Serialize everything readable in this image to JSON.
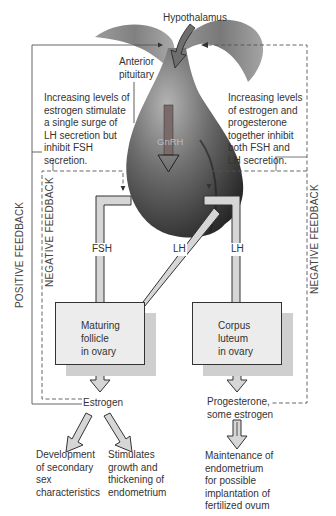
{
  "diagram": {
    "type": "hormonal-feedback-flowchart",
    "nodes": {
      "hypothalamus": "Hypothalamus",
      "anterior_pituitary": [
        "Anterior",
        "pituitary"
      ],
      "gnrh": "GnRH",
      "fsh": "FSH",
      "lh_left": "LH",
      "lh_right": "LH",
      "maturing_follicle": [
        "Maturing",
        "follicle",
        "in ovary"
      ],
      "corpus_luteum": [
        "Corpus",
        "luteum",
        "in ovary"
      ],
      "estrogen": "Estrogen",
      "progesterone": [
        "Progesterone,",
        "some estrogen"
      ],
      "secondary_sex": [
        "Development",
        "of secondary",
        "sex",
        "characteristics"
      ],
      "endometrium_growth": [
        "Stimulates",
        "growth and",
        "thickening of",
        "endometrium"
      ],
      "endometrium_maintenance": [
        "Maintenance of",
        "endometrium",
        "for possible",
        "implantation of",
        "fertilized ovum"
      ]
    },
    "annotations": {
      "positive_note": [
        "Increasing levels of",
        "estrogen stimulate",
        "a single surge of",
        "LH secretion but",
        "inhibit FSH",
        "secretion."
      ],
      "negative_note": [
        "Increasing levels",
        "of estrogen and",
        "progesterone",
        "together inhibit",
        "both FSH and",
        "LH secretion."
      ]
    },
    "feedback_labels": {
      "positive_left": "POSITIVE FEEDBACK",
      "negative_left": "NEGATIVE FEEDBACK",
      "negative_right": "NEGATIVE FEEDBACK"
    },
    "colors": {
      "pituitary_dark": "#2e2e2e",
      "pituitary_light": "#9a9a9a",
      "arrow_fill": "#d6d6d6",
      "line": "#444444",
      "box_fill": "#ececec",
      "box_shadow": "#cfcfcf"
    }
  }
}
